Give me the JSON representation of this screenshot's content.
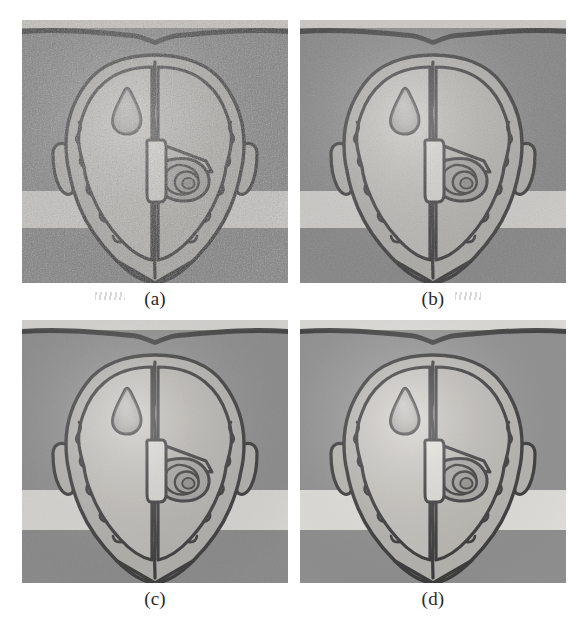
{
  "figure": {
    "type": "medical-illustration-grid",
    "rows": 2,
    "columns": 2,
    "background_color": "#ffffff",
    "panel_count": 4
  },
  "panels": [
    {
      "id": "panel-a",
      "caption": "(a)",
      "position": {
        "x": 22,
        "y": 20,
        "width": 266,
        "height": 263
      },
      "caption_y": 288,
      "description": "Axial head cross-section, noisiest / lowest contrast rendering",
      "noise_level": "high",
      "brightness": 1.0,
      "bands": [
        {
          "name": "top-light-strip",
          "y": 0,
          "height": 8,
          "color": "#d8d6d2"
        },
        {
          "name": "upper-dark-band",
          "y": 8,
          "height": 163,
          "color": "#8c8c8c"
        },
        {
          "name": "mid-light-band",
          "y": 171,
          "height": 37,
          "color": "#d9d7d3"
        },
        {
          "name": "lower-dark-band",
          "y": 208,
          "height": 55,
          "color": "#8a8a8a"
        }
      ]
    },
    {
      "id": "panel-b",
      "caption": "(b)",
      "position": {
        "x": 300,
        "y": 20,
        "width": 266,
        "height": 263
      },
      "caption_y": 288,
      "description": "Axial head cross-section, moderately denoised",
      "noise_level": "medium",
      "brightness": 1.02,
      "bands": [
        {
          "name": "top-light-strip",
          "y": 0,
          "height": 8,
          "color": "#d8d6d2"
        },
        {
          "name": "upper-dark-band",
          "y": 8,
          "height": 163,
          "color": "#8c8c8c"
        },
        {
          "name": "mid-light-band",
          "y": 171,
          "height": 37,
          "color": "#d9d7d3"
        },
        {
          "name": "lower-dark-band",
          "y": 208,
          "height": 55,
          "color": "#8a8a8a"
        }
      ]
    },
    {
      "id": "panel-c",
      "caption": "(c)",
      "position": {
        "x": 22,
        "y": 320,
        "width": 266,
        "height": 263
      },
      "caption_y": 588,
      "description": "Axial head cross-section, smoother rendering",
      "noise_level": "low",
      "brightness": 1.03,
      "bands": [
        {
          "name": "top-light-strip",
          "y": 0,
          "height": 10,
          "color": "#dcdad6"
        },
        {
          "name": "upper-dark-band",
          "y": 10,
          "height": 160,
          "color": "#8f8f8f"
        },
        {
          "name": "mid-light-band",
          "y": 170,
          "height": 40,
          "color": "#dddbd7"
        },
        {
          "name": "lower-dark-band",
          "y": 210,
          "height": 53,
          "color": "#8c8c8c"
        }
      ]
    },
    {
      "id": "panel-d",
      "caption": "(d)",
      "position": {
        "x": 300,
        "y": 320,
        "width": 266,
        "height": 263
      },
      "caption_y": 588,
      "description": "Axial head cross-section, smoothest / highest contrast rendering",
      "noise_level": "lowest",
      "brightness": 1.05,
      "bands": [
        {
          "name": "top-light-strip",
          "y": 0,
          "height": 10,
          "color": "#dedcd8"
        },
        {
          "name": "upper-dark-band",
          "y": 10,
          "height": 160,
          "color": "#929292"
        },
        {
          "name": "mid-light-band",
          "y": 170,
          "height": 40,
          "color": "#e0ded9"
        },
        {
          "name": "lower-dark-band",
          "y": 210,
          "height": 53,
          "color": "#8e8e8e"
        }
      ]
    }
  ],
  "anatomy": {
    "outline_stroke": "#3a3a3a",
    "skull_fill": "#b5b3ae",
    "brain_fill": "#c2c0bb",
    "brain_fill_right": "#b9b7b2",
    "lesion_fill": "#a9a7a2",
    "lesion_name": "pear-shaped-lesion",
    "ventricle_fill": "#d9d7d2",
    "ventricle_name": "midline-ventricle-strip",
    "structure_fill": "#a5a3a0",
    "structure_name": "right-basal-structure",
    "ear_name": "temporal-ear-protrusion",
    "falx_name": "midline-falx"
  },
  "artifacts": [
    {
      "name": "scan-smudge-left",
      "x": 95,
      "y": 292,
      "width": 30,
      "height": 8
    },
    {
      "name": "scan-smudge-right",
      "x": 455,
      "y": 292,
      "width": 26,
      "height": 8
    }
  ]
}
